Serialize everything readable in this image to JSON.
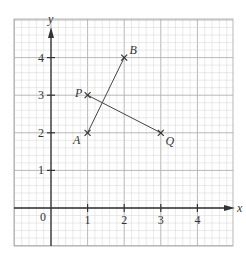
{
  "diagram": {
    "type": "coordinate-grid",
    "axes": {
      "x_label": "x",
      "y_label": "y",
      "origin_label": "0",
      "x_ticks": [
        {
          "value": 1,
          "label": "1"
        },
        {
          "value": 2,
          "label": "2"
        },
        {
          "value": 3,
          "label": "3"
        },
        {
          "value": 4,
          "label": "4"
        }
      ],
      "y_ticks": [
        {
          "value": 1,
          "label": "1"
        },
        {
          "value": 2,
          "label": "2"
        },
        {
          "value": 3,
          "label": "3"
        },
        {
          "value": 4,
          "label": "4"
        }
      ],
      "x_range": [
        -1,
        5
      ],
      "y_range": [
        -1,
        5
      ],
      "minor_divisions": 5
    },
    "points": [
      {
        "name": "A",
        "x": 1,
        "y": 2,
        "label_pos": "below-left"
      },
      {
        "name": "B",
        "x": 2,
        "y": 4,
        "label_pos": "above-right"
      },
      {
        "name": "P",
        "x": 1,
        "y": 3,
        "label_pos": "left"
      },
      {
        "name": "Q",
        "x": 3,
        "y": 2,
        "label_pos": "below-right"
      }
    ],
    "segments": [
      {
        "from": "A",
        "to": "B"
      },
      {
        "from": "P",
        "to": "Q"
      }
    ],
    "colors": {
      "minor_grid": "#d4d4d4",
      "major_grid": "#b0b0b0",
      "axis": "#333333",
      "segment": "#444444",
      "text": "#333333"
    }
  }
}
